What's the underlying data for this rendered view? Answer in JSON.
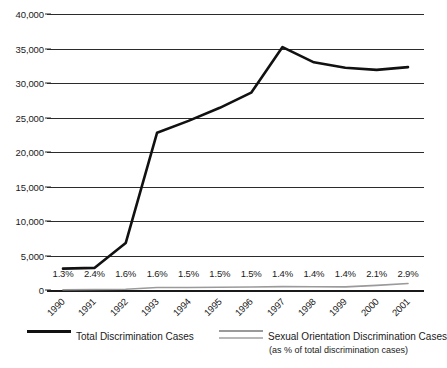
{
  "chart_data": {
    "type": "line",
    "title": "",
    "xlabel": "",
    "ylabel": "",
    "ylim": [
      0,
      40000
    ],
    "grid": true,
    "legend_position": "bottom",
    "categories": [
      "1990",
      "1991",
      "1992",
      "1993",
      "1994",
      "1995",
      "1996",
      "1997",
      "1998",
      "1999",
      "2000",
      "2001"
    ],
    "ytick_labels": [
      "40,000",
      "35,000",
      "30,000",
      "25,000",
      "20,000",
      "15,000",
      "10,000",
      "5,000",
      "0"
    ],
    "ytick_values": [
      40000,
      35000,
      30000,
      25000,
      20000,
      15000,
      10000,
      5000,
      0
    ],
    "series": [
      {
        "name": "Total Discrimination Cases",
        "color": "#111111",
        "values": [
          3100,
          3200,
          6800,
          22800,
          24500,
          26400,
          28600,
          35200,
          33000,
          32200,
          31900,
          32300
        ]
      },
      {
        "name": "Sexual Orientation Discrimination Cases",
        "color": "#9a9a9a",
        "note": "as % of total discrimination cases",
        "percent_labels": [
          "1.3%",
          "2.4%",
          "1.6%",
          "1.6%",
          "1.5%",
          "1.5%",
          "1.5%",
          "1.4%",
          "1.4%",
          "1.4%",
          "2.1%",
          "2.9%"
        ],
        "values": [
          40,
          77,
          109,
          365,
          368,
          396,
          429,
          493,
          462,
          451,
          670,
          937
        ]
      }
    ]
  },
  "legend": {
    "total_label": "Total Discrimination Cases",
    "sexor_label": "Sexual Orientation Discrimination Cases",
    "sexor_sublabel": "(as % of total discrimination cases)"
  },
  "caption": {
    "text": ""
  },
  "colors": {
    "total_series": "#111111",
    "sexor_series": "#9a9a9a",
    "gridline": "#2b2b2b",
    "axis": "#1a1a1a"
  }
}
